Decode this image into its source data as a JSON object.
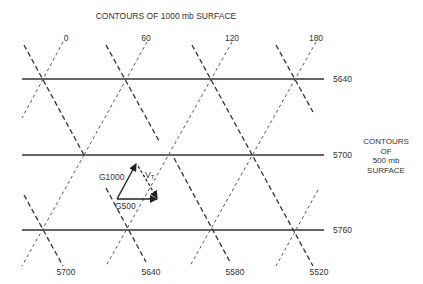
{
  "title": "CONTOURS OF 1000 mb SURFACE",
  "side_label": [
    "CONTOURS",
    "OF",
    "500 mb",
    "SURFACE"
  ],
  "top_labels": [
    "0",
    "60",
    "120",
    "180"
  ],
  "bottom_labels": [
    "5700",
    "5640",
    "5580",
    "5520"
  ],
  "horizontal_contours": [
    {
      "label": "5640",
      "y": 79
    },
    {
      "label": "5700",
      "y": 155
    },
    {
      "label": "5760",
      "y": 230
    }
  ],
  "vectors": {
    "g1000": "G1000",
    "g500": "G500",
    "vt": "V",
    "vt_sub": "T"
  },
  "colors": {
    "line": "#333333",
    "dash": "#444444",
    "background": "#ffffff"
  }
}
